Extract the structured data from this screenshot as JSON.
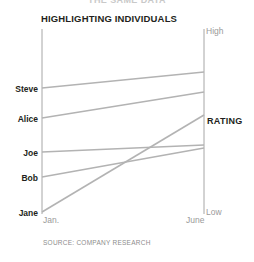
{
  "supertitle": "THE SAME DATA",
  "title": "HIGHLIGHTING INDIVIDUALS",
  "source": "SOURCE: COMPANY RESEARCH",
  "axis": {
    "title": "RATING",
    "high_label": "High",
    "low_label": "Low",
    "x_left_label": "Jan.",
    "x_right_label": "June"
  },
  "colors": {
    "line": "#b3b3b3",
    "axis": "#a6a6a6",
    "text_dark": "#231f20",
    "text_muted": "#9a9a9a",
    "background": "#ffffff"
  },
  "categories": [
    "Steve",
    "Alice",
    "Joe",
    "Bob",
    "Jane"
  ],
  "chart_data": {
    "type": "line",
    "subtype": "slopegraph",
    "title": "HIGHLIGHTING INDIVIDUALS",
    "xlabel": "",
    "ylabel": "RATING",
    "x": [
      "Jan.",
      "June"
    ],
    "xtick_labels": [
      "Jan.",
      "June"
    ],
    "ytick_labels": [
      "Low",
      "High"
    ],
    "ylim": [
      0,
      100
    ],
    "ylim_labels": [
      "Low",
      "High"
    ],
    "grid": false,
    "legend": "none",
    "series": [
      {
        "name": "Steve",
        "values": [
          68,
          76
        ],
        "label_side": "left"
      },
      {
        "name": "Alice",
        "values": [
          52,
          64
        ],
        "label_side": "left"
      },
      {
        "name": "Joe",
        "values": [
          34,
          38
        ],
        "label_side": "left"
      },
      {
        "name": "Bob",
        "values": [
          21,
          36
        ],
        "label_side": "left"
      },
      {
        "name": "Jane",
        "values": [
          3,
          52
        ],
        "label_side": "left"
      }
    ],
    "annotations": [
      "SOURCE: COMPANY RESEARCH"
    ]
  },
  "geometry": {
    "x_left": 42,
    "x_right": 204,
    "y_top": 29,
    "y_bottom": 214,
    "points": [
      {
        "name": "Steve",
        "y1": 88,
        "y2": 72
      },
      {
        "name": "Alice",
        "y1": 118,
        "y2": 92
      },
      {
        "name": "Joe",
        "y1": 152,
        "y2": 145
      },
      {
        "name": "Bob",
        "y1": 177,
        "y2": 148
      },
      {
        "name": "Jane",
        "y1": 212,
        "y2": 115
      }
    ],
    "scale_labels": [
      {
        "text": "High",
        "y": 31
      },
      {
        "text": "Low",
        "y": 212
      }
    ]
  }
}
